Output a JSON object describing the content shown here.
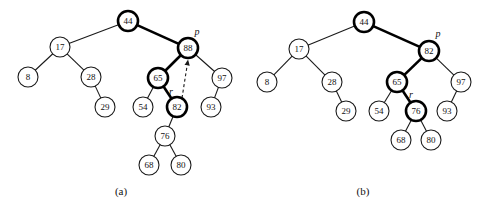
{
  "figure": {
    "background_color": "#ffffff",
    "stroke_color": "#1a1a1a",
    "highlight_color": "#000000",
    "width": 486,
    "height": 210
  },
  "panels": [
    {
      "id": "a",
      "caption": "(a)",
      "caption_x": 121,
      "caption_y": 192,
      "pointer_labels": [
        {
          "name": "p",
          "text": "p",
          "x": 197,
          "y": 33
        },
        {
          "name": "r",
          "text": "r",
          "x": 171,
          "y": 93
        }
      ],
      "dashed_arrow": {
        "name": "r-to-p-dashed-arrow",
        "from_x": 182,
        "from_y": 98,
        "to_x": 188,
        "to_y": 60
      },
      "nodes": [
        {
          "name": "node-44",
          "value": "44",
          "x": 128,
          "y": 21,
          "r": 10,
          "highlight": true
        },
        {
          "name": "node-17",
          "value": "17",
          "x": 60,
          "y": 47,
          "r": 10,
          "highlight": false
        },
        {
          "name": "node-88",
          "value": "88",
          "x": 188,
          "y": 48,
          "r": 10,
          "highlight": true
        },
        {
          "name": "node-8",
          "value": "8",
          "x": 28,
          "y": 77,
          "r": 10,
          "highlight": false
        },
        {
          "name": "node-28",
          "value": "28",
          "x": 91,
          "y": 77,
          "r": 10,
          "highlight": false
        },
        {
          "name": "node-65",
          "value": "65",
          "x": 158,
          "y": 78,
          "r": 10,
          "highlight": true
        },
        {
          "name": "node-97",
          "value": "97",
          "x": 222,
          "y": 78,
          "r": 10,
          "highlight": false
        },
        {
          "name": "node-29",
          "value": "29",
          "x": 105,
          "y": 107,
          "r": 10,
          "highlight": false
        },
        {
          "name": "node-54",
          "value": "54",
          "x": 143,
          "y": 107,
          "r": 10,
          "highlight": false
        },
        {
          "name": "node-82",
          "value": "82",
          "x": 177,
          "y": 107,
          "r": 10,
          "highlight": true
        },
        {
          "name": "node-93",
          "value": "93",
          "x": 211,
          "y": 107,
          "r": 10,
          "highlight": false
        },
        {
          "name": "node-76",
          "value": "76",
          "x": 165,
          "y": 136,
          "r": 10,
          "highlight": false
        },
        {
          "name": "node-68",
          "value": "68",
          "x": 149,
          "y": 165,
          "r": 10,
          "highlight": false
        },
        {
          "name": "node-80",
          "value": "80",
          "x": 181,
          "y": 165,
          "r": 10,
          "highlight": false
        }
      ],
      "edges": [
        {
          "name": "edge-44-17",
          "from": "44",
          "to": "17",
          "thick": false
        },
        {
          "name": "edge-44-88",
          "from": "44",
          "to": "88",
          "thick": true
        },
        {
          "name": "edge-17-8",
          "from": "17",
          "to": "8",
          "thick": false
        },
        {
          "name": "edge-17-28",
          "from": "17",
          "to": "28",
          "thick": false
        },
        {
          "name": "edge-28-29",
          "from": "28",
          "to": "29",
          "thick": false
        },
        {
          "name": "edge-88-65",
          "from": "88",
          "to": "65",
          "thick": true
        },
        {
          "name": "edge-88-97",
          "from": "88",
          "to": "97",
          "thick": false
        },
        {
          "name": "edge-65-54",
          "from": "65",
          "to": "54",
          "thick": false
        },
        {
          "name": "edge-65-82",
          "from": "65",
          "to": "82",
          "thick": true
        },
        {
          "name": "edge-97-93",
          "from": "97",
          "to": "93",
          "thick": false
        },
        {
          "name": "edge-82-76",
          "from": "82",
          "to": "76",
          "thick": false
        },
        {
          "name": "edge-76-68",
          "from": "76",
          "to": "68",
          "thick": false
        },
        {
          "name": "edge-76-80",
          "from": "76",
          "to": "80",
          "thick": false
        }
      ]
    },
    {
      "id": "b",
      "caption": "(b)",
      "caption_x": 363,
      "caption_y": 192,
      "pointer_labels": [
        {
          "name": "p",
          "text": "p",
          "x": 438,
          "y": 35
        },
        {
          "name": "r",
          "text": "r",
          "x": 411,
          "y": 96
        }
      ],
      "dashed_arrow": null,
      "nodes": [
        {
          "name": "node-44",
          "value": "44",
          "x": 364,
          "y": 22,
          "r": 10,
          "highlight": true
        },
        {
          "name": "node-17",
          "value": "17",
          "x": 299,
          "y": 49,
          "r": 10,
          "highlight": false
        },
        {
          "name": "node-82",
          "value": "82",
          "x": 429,
          "y": 51,
          "r": 10,
          "highlight": true
        },
        {
          "name": "node-8",
          "value": "8",
          "x": 267,
          "y": 82,
          "r": 10,
          "highlight": false
        },
        {
          "name": "node-28",
          "value": "28",
          "x": 332,
          "y": 82,
          "r": 10,
          "highlight": false
        },
        {
          "name": "node-65",
          "value": "65",
          "x": 397,
          "y": 82,
          "r": 10,
          "highlight": true
        },
        {
          "name": "node-97",
          "value": "97",
          "x": 461,
          "y": 82,
          "r": 10,
          "highlight": false
        },
        {
          "name": "node-29",
          "value": "29",
          "x": 346,
          "y": 111,
          "r": 10,
          "highlight": false
        },
        {
          "name": "node-54",
          "value": "54",
          "x": 379,
          "y": 111,
          "r": 10,
          "highlight": false
        },
        {
          "name": "node-76",
          "value": "76",
          "x": 416,
          "y": 111,
          "r": 10,
          "highlight": true
        },
        {
          "name": "node-93",
          "value": "93",
          "x": 447,
          "y": 111,
          "r": 10,
          "highlight": false
        },
        {
          "name": "node-68",
          "value": "68",
          "x": 401,
          "y": 140,
          "r": 10,
          "highlight": false
        },
        {
          "name": "node-80",
          "value": "80",
          "x": 431,
          "y": 140,
          "r": 10,
          "highlight": false
        }
      ],
      "edges": [
        {
          "name": "edge-44-17",
          "from": "44",
          "to": "17",
          "thick": false
        },
        {
          "name": "edge-44-82",
          "from": "44",
          "to": "82",
          "thick": true
        },
        {
          "name": "edge-17-8",
          "from": "17",
          "to": "8",
          "thick": false
        },
        {
          "name": "edge-17-28",
          "from": "17",
          "to": "28",
          "thick": false
        },
        {
          "name": "edge-28-29",
          "from": "28",
          "to": "29",
          "thick": false
        },
        {
          "name": "edge-82-65",
          "from": "82",
          "to": "65",
          "thick": true
        },
        {
          "name": "edge-82-97",
          "from": "82",
          "to": "97",
          "thick": false
        },
        {
          "name": "edge-65-54",
          "from": "65",
          "to": "54",
          "thick": false
        },
        {
          "name": "edge-65-76",
          "from": "65",
          "to": "76",
          "thick": true
        },
        {
          "name": "edge-97-93",
          "from": "97",
          "to": "93",
          "thick": false
        },
        {
          "name": "edge-76-68",
          "from": "76",
          "to": "68",
          "thick": false
        },
        {
          "name": "edge-76-80",
          "from": "76",
          "to": "80",
          "thick": false
        }
      ]
    }
  ]
}
